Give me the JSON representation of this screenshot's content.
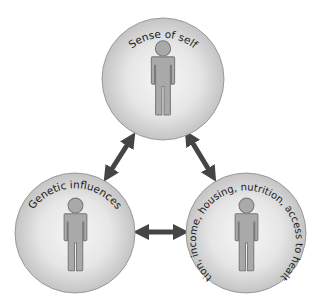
{
  "diagram": {
    "title": "",
    "nodes": [
      {
        "id": "top",
        "label": "Sense of self",
        "icon": "person-icon",
        "cx": 163,
        "cy": 79,
        "r": 61
      },
      {
        "id": "left",
        "label": "Genetic influences",
        "icon": "person-icon",
        "cx": 75,
        "cy": 233,
        "r": 60
      },
      {
        "id": "right",
        "label": "Education, income, housing, nutrition, access to health care",
        "icon": "person-icon",
        "cx": 246,
        "cy": 233,
        "r": 60
      }
    ],
    "edges": [
      {
        "from": "top",
        "to": "left",
        "type": "bidirectional-arrow"
      },
      {
        "from": "top",
        "to": "right",
        "type": "bidirectional-arrow"
      },
      {
        "from": "left",
        "to": "right",
        "type": "bidirectional-arrow"
      }
    ],
    "colors": {
      "circle_center": "#f4f4f4",
      "circle_edge": "#c8c8c8",
      "circle_stroke": "#8a8a8a",
      "figure_fill": "#a9a9a9",
      "figure_stroke": "#7a7a7a",
      "arrow": "#454545",
      "text": "#1a1a1a"
    }
  }
}
